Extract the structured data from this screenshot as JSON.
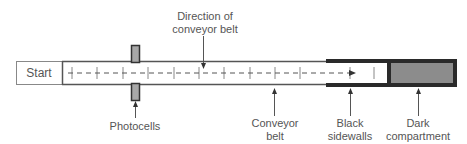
{
  "diagram": {
    "start_label": "Start",
    "direction_label_line1": "Direction of",
    "direction_label_line2": "conveyor belt",
    "photocells_label": "Photocells",
    "conveyor_label_line1": "Conveyor",
    "conveyor_label_line2": "belt",
    "sidewalls_label_line1": "Black",
    "sidewalls_label_line2": "sidewalls",
    "compartment_label_line1": "Dark",
    "compartment_label_line2": "compartment",
    "colors": {
      "outline": "#555555",
      "sidewall": "#2a2a2a",
      "compartment_fill": "#8c8c8c",
      "photocell_fill": "#a8a8a8",
      "text": "#555555"
    }
  }
}
